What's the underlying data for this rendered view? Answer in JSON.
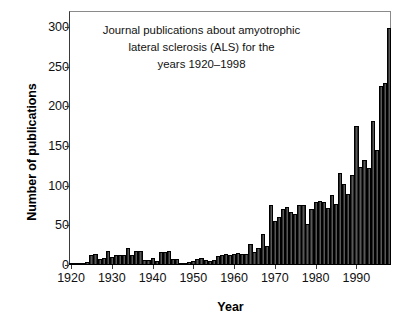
{
  "chart_data": {
    "type": "bar",
    "title_lines": [
      "Journal publications about amyotrophic",
      "lateral sclerosis (ALS) for the",
      "years 1920–1998"
    ],
    "xlabel": "Year",
    "ylabel": "Number of publications",
    "xlim": [
      1919.5,
      1998.5
    ],
    "ylim": [
      0,
      320
    ],
    "yticks": [
      0,
      50,
      100,
      150,
      200,
      250,
      300
    ],
    "ytick_labels": [
      "0",
      "50",
      "100",
      "150",
      "200",
      "250",
      "300"
    ],
    "xticks": [
      1920,
      1930,
      1940,
      1950,
      1960,
      1970,
      1980,
      1990
    ],
    "xtick_labels": [
      "1920",
      "1930",
      "1940",
      "1950",
      "1960",
      "1970",
      "1980",
      "1990"
    ],
    "grid": false,
    "legend": null,
    "bar_color": "#3b3b3b",
    "bar_edge_color": "#000000",
    "categories": [
      1920,
      1921,
      1922,
      1923,
      1924,
      1925,
      1926,
      1927,
      1928,
      1929,
      1930,
      1931,
      1932,
      1933,
      1934,
      1935,
      1936,
      1937,
      1938,
      1939,
      1940,
      1941,
      1942,
      1943,
      1944,
      1945,
      1946,
      1947,
      1948,
      1949,
      1950,
      1951,
      1952,
      1953,
      1954,
      1955,
      1956,
      1957,
      1958,
      1959,
      1960,
      1961,
      1962,
      1963,
      1964,
      1965,
      1966,
      1967,
      1968,
      1969,
      1970,
      1971,
      1972,
      1973,
      1974,
      1975,
      1976,
      1977,
      1978,
      1979,
      1980,
      1981,
      1982,
      1983,
      1984,
      1985,
      1986,
      1987,
      1988,
      1989,
      1990,
      1991,
      1992,
      1993,
      1994,
      1995,
      1996,
      1997,
      1998
    ],
    "values": [
      1,
      1,
      2,
      2,
      4,
      13,
      14,
      7,
      9,
      18,
      10,
      12,
      13,
      13,
      21,
      12,
      18,
      18,
      6,
      6,
      9,
      5,
      16,
      17,
      18,
      7,
      8,
      2,
      2,
      4,
      5,
      7,
      9,
      6,
      5,
      6,
      11,
      13,
      14,
      13,
      14,
      15,
      14,
      14,
      26,
      16,
      22,
      39,
      24,
      75,
      56,
      61,
      71,
      73,
      67,
      64,
      75,
      75,
      52,
      71,
      79,
      81,
      80,
      72,
      88,
      77,
      116,
      102,
      90,
      113,
      175,
      123,
      132,
      122,
      182,
      145,
      225,
      229,
      298
    ],
    "series_name": "Number of publications"
  },
  "axes": {
    "y_title": "Number of publications",
    "x_title": "Year"
  }
}
